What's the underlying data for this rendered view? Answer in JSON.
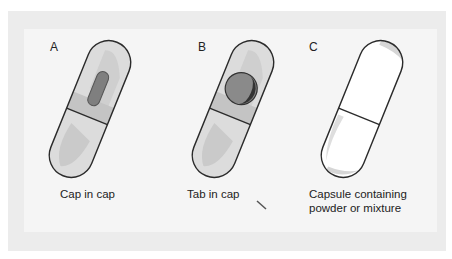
{
  "figure": {
    "panels": [
      {
        "letter": "A",
        "caption": "Cap in cap",
        "content": "small elongated capsule inside cap"
      },
      {
        "letter": "B",
        "caption": "Tab in cap",
        "content": "round tablet inside cap"
      },
      {
        "letter": "C",
        "caption": "Capsule containing\npowder or mixture",
        "content": "empty capsule outline"
      }
    ]
  },
  "colors": {
    "frame": "#ececec",
    "panel": "#f5f5f5",
    "capsule_fill": "#dcdcdc",
    "capsule_shade": "#c8c8c8",
    "band": "#bdbdbd",
    "inner_object": "#8a8a8a",
    "inner_dark": "#3a3a3a",
    "outline": "#2b2b2b"
  }
}
